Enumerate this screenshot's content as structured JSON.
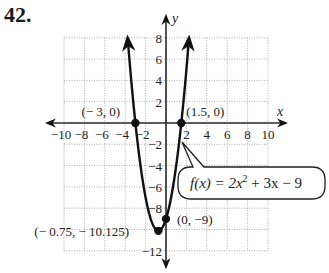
{
  "problem": {
    "number": "42."
  },
  "chart_data": {
    "type": "line",
    "title": "",
    "function": "f(x) = 2x^2 + 3x - 9",
    "coefficients": {
      "a": 2,
      "b": 3,
      "c": -9
    },
    "domain_plotted": [
      -3.76,
      2.26
    ],
    "xlabel": "x",
    "ylabel": "y",
    "xlim": [
      -10,
      10
    ],
    "ylim": [
      -12,
      8
    ],
    "x_ticks": [
      -10,
      -8,
      -6,
      -4,
      -2,
      2,
      4,
      6,
      8,
      10
    ],
    "y_ticks": [
      8,
      6,
      4,
      2,
      -2,
      -4,
      -6,
      -8,
      -12
    ],
    "grid": true,
    "grid_step": 2,
    "points": [
      {
        "x": -3,
        "y": 0,
        "label": "(− 3, 0)"
      },
      {
        "x": 1.5,
        "y": 0,
        "label": "(1.5, 0)"
      },
      {
        "x": 0,
        "y": -9,
        "label": "(0, −9)"
      },
      {
        "x": -0.75,
        "y": -10.125,
        "label": "(− 0.75, − 10.125)"
      }
    ],
    "annotation": {
      "text_prefix": "f(x) = 2x",
      "superscript": "2",
      "text_suffix": " + 3x − 9"
    }
  }
}
